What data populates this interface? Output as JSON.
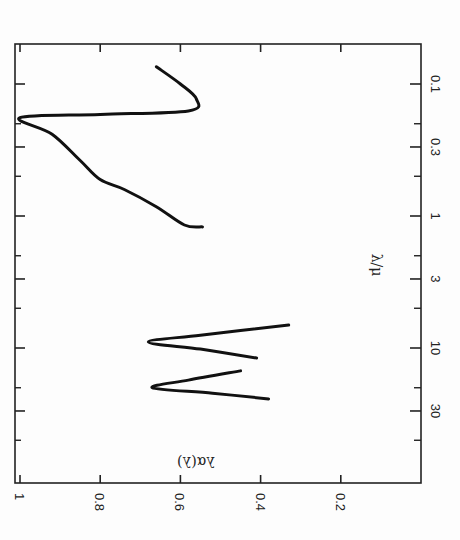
{
  "chart_data": {
    "type": "line",
    "title": "",
    "orientation": "rotated 90 degrees clockwise (x-axis vertical on right, y-axis horizontal on bottom)",
    "xlabel": "λ/μ",
    "ylabel": "λα(λ)",
    "xscale": "log",
    "xlim": [
      0.05,
      90
    ],
    "ylim": [
      0,
      1.0
    ],
    "x_ticks": [
      {
        "value": 0.1,
        "label": "0.1"
      },
      {
        "value": 0.3,
        "label": "0.3"
      },
      {
        "value": 1,
        "label": "1"
      },
      {
        "value": 3,
        "label": "3"
      },
      {
        "value": 10,
        "label": "10"
      },
      {
        "value": 30,
        "label": "30"
      }
    ],
    "x_minor_ticks": [
      0.2,
      0.5,
      2,
      5,
      20,
      50
    ],
    "y_ticks": [
      {
        "value": 1.0,
        "label": "1"
      },
      {
        "value": 0.8,
        "label": "0.8"
      },
      {
        "value": 0.6,
        "label": "0.6"
      },
      {
        "value": 0.4,
        "label": "0.4"
      },
      {
        "value": 0.2,
        "label": "0.2"
      }
    ],
    "grid": false,
    "legend": null,
    "series": [
      {
        "name": "UV-optical band",
        "points": [
          {
            "x": 0.074,
            "y": 0.66
          },
          {
            "x": 0.1,
            "y": 0.6
          },
          {
            "x": 0.13,
            "y": 0.56
          },
          {
            "x": 0.16,
            "y": 0.58
          },
          {
            "x": 0.17,
            "y": 0.8
          },
          {
            "x": 0.18,
            "y": 1.0
          },
          {
            "x": 0.24,
            "y": 0.92
          },
          {
            "x": 0.38,
            "y": 0.85
          },
          {
            "x": 0.53,
            "y": 0.8
          },
          {
            "x": 0.63,
            "y": 0.74
          },
          {
            "x": 0.85,
            "y": 0.66
          },
          {
            "x": 1.17,
            "y": 0.59
          },
          {
            "x": 1.21,
            "y": 0.545
          }
        ]
      },
      {
        "name": "10 μm feature",
        "points": [
          {
            "x": 6.7,
            "y": 0.33
          },
          {
            "x": 8.0,
            "y": 0.55
          },
          {
            "x": 9.0,
            "y": 0.68
          },
          {
            "x": 10.2,
            "y": 0.55
          },
          {
            "x": 11.9,
            "y": 0.41
          }
        ]
      },
      {
        "name": "20 μm feature",
        "points": [
          {
            "x": 14.9,
            "y": 0.45
          },
          {
            "x": 17.5,
            "y": 0.58
          },
          {
            "x": 20.0,
            "y": 0.67
          },
          {
            "x": 22.0,
            "y": 0.52
          },
          {
            "x": 24.3,
            "y": 0.38
          }
        ]
      }
    ]
  },
  "axes": {
    "x_title": "λ/μ",
    "y_title": "λα(λ)"
  }
}
